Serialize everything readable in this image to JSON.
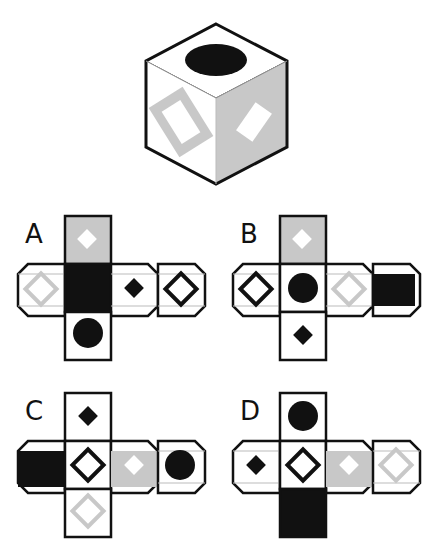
{
  "colors": {
    "outline": "#111111",
    "gray": "#c8c8c8",
    "black": "#111111",
    "white": "#ffffff"
  },
  "cube": {
    "top": "black-circle",
    "left": "gray-rectangle-outline",
    "right": "white-diamond-on-gray"
  },
  "options": [
    {
      "label": "A",
      "top": "white-diamond-on-gray",
      "row": [
        "gray-diamond-outline",
        "black-square",
        "black-diamond-small",
        "black-diamond-outline"
      ],
      "bottom": "black-circle"
    },
    {
      "label": "B",
      "top": "white-diamond-on-gray",
      "row": [
        "black-diamond-outline",
        "black-circle",
        "gray-diamond-outline",
        "black-square"
      ],
      "bottom": "black-diamond-small"
    },
    {
      "label": "C",
      "top": "black-diamond-small",
      "row": [
        "black-square",
        "black-diamond-outline",
        "white-diamond-on-gray",
        "black-circle"
      ],
      "bottom": "gray-diamond-outline"
    },
    {
      "label": "D",
      "top": "black-circle",
      "row": [
        "black-diamond-small",
        "black-diamond-outline",
        "white-diamond-on-gray",
        "gray-diamond-outline"
      ],
      "bottom": "black-square"
    }
  ]
}
